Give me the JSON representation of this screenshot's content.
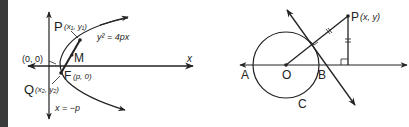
{
  "figure_left": {
    "title": "Parabola focal chord",
    "axis_x_label": "x",
    "origin_label": "(0, 0)",
    "point_P": {
      "name": "P",
      "coords": "(x₁, y₁)"
    },
    "point_Q": {
      "name": "Q",
      "coords": "(x₂, y₂)"
    },
    "point_F": {
      "name": "F",
      "coords": "(p, 0)"
    },
    "point_M": {
      "name": "M"
    },
    "equation": "y² = 4px",
    "directrix": "x = −p"
  },
  "figure_right": {
    "title": "Circle tangent construction",
    "point_P": {
      "name": "P",
      "coords": "(x, y)"
    },
    "point_A": "A",
    "point_O": "O",
    "point_B": "B",
    "circle_label": "C"
  },
  "colors": {
    "ink": "#222222",
    "left_bar": "#3a3a3a",
    "background": "#ffffff"
  }
}
